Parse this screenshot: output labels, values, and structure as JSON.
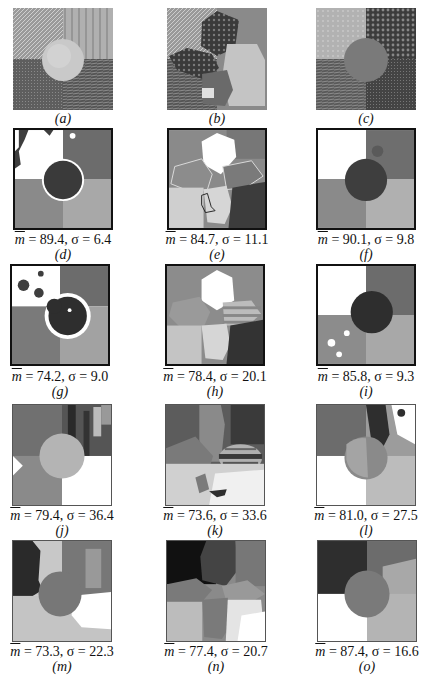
{
  "figure": {
    "panels": [
      {
        "id": "a",
        "label": "(a)",
        "kind": "source texture mosaic",
        "metric": null
      },
      {
        "id": "b",
        "label": "(b)",
        "kind": "source texture mosaic",
        "metric": null
      },
      {
        "id": "c",
        "label": "(c)",
        "kind": "source texture mosaic",
        "metric": null
      },
      {
        "id": "d",
        "label": "(d)",
        "kind": "segmentation",
        "m": "89.4",
        "sigma": "6.4"
      },
      {
        "id": "e",
        "label": "(e)",
        "kind": "segmentation",
        "m": "84.7",
        "sigma": "11.1"
      },
      {
        "id": "f",
        "label": "(f)",
        "kind": "segmentation",
        "m": "90.1",
        "sigma": "9.8"
      },
      {
        "id": "g",
        "label": "(g)",
        "kind": "segmentation",
        "m": "74.2",
        "sigma": "9.0"
      },
      {
        "id": "h",
        "label": "(h)",
        "kind": "segmentation",
        "m": "78.4",
        "sigma": "20.1"
      },
      {
        "id": "i",
        "label": "(i)",
        "kind": "segmentation",
        "m": "85.8",
        "sigma": "9.3"
      },
      {
        "id": "j",
        "label": "(j)",
        "kind": "segmentation",
        "m": "79.4",
        "sigma": "36.4"
      },
      {
        "id": "k",
        "label": "(k)",
        "kind": "segmentation",
        "m": "73.6",
        "sigma": "33.6"
      },
      {
        "id": "l",
        "label": "(l)",
        "kind": "segmentation",
        "m": "81.0",
        "sigma": "27.5"
      },
      {
        "id": "m",
        "label": "(m)",
        "kind": "segmentation",
        "m": "73.3",
        "sigma": "22.3"
      },
      {
        "id": "n",
        "label": "(n)",
        "kind": "segmentation",
        "m": "77.4",
        "sigma": "20.7"
      },
      {
        "id": "o",
        "label": "(o)",
        "kind": "segmentation",
        "m": "87.4",
        "sigma": "16.6"
      }
    ],
    "metric_labels": {
      "m_symbol": "m",
      "eq": " = ",
      "sep": ", ",
      "sigma_symbol": "σ"
    }
  }
}
